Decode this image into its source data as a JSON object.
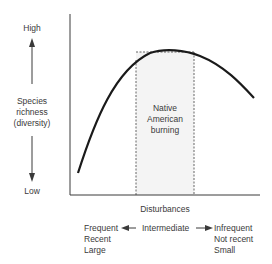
{
  "yaxis": {
    "high_label": "High",
    "title_line1": "Species",
    "title_line2": "richness",
    "title_line3": "(diversity)",
    "low_label": "Low"
  },
  "xaxis": {
    "title": "Disturbances",
    "left_line1": "Frequent",
    "left_line2": "Recent",
    "left_line3": "Large",
    "middle": "Intermediate",
    "right_line1": "Infrequent",
    "right_line2": "Not recent",
    "right_line3": "Small"
  },
  "region": {
    "label_line1": "Native",
    "label_line2": "American",
    "label_line3": "burning"
  },
  "colors": {
    "curve": "#1a1a1a",
    "axis": "#3a3a3a",
    "region_fill": "#f4f4f4",
    "text": "#3a3a3a"
  }
}
